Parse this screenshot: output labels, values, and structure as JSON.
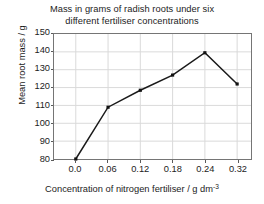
{
  "chart_data": {
    "type": "line",
    "title": "Mass in grams of radish roots under six different fertiliser concentrations",
    "title_lines": [
      "Mass in grams of radish roots under six",
      "different fertiliser concentrations"
    ],
    "xlabel": "Concentration of nitrogen fertiliser / g dm",
    "xlabel_exponent": "-3",
    "ylabel": "Mean root mass / g",
    "x_tick_labels": [
      "0.0",
      "0.06",
      "0.12",
      "0.18",
      "0.24",
      "0.32"
    ],
    "x": [
      0.0,
      0.06,
      0.12,
      0.18,
      0.24,
      0.32
    ],
    "categories": [
      "0.0",
      "0.06",
      "0.12",
      "0.18",
      "0.24",
      "0.32"
    ],
    "values": [
      80,
      109,
      118.5,
      127,
      139.5,
      122
    ],
    "y_tick_labels": [
      "150",
      "140",
      "130",
      "120",
      "110",
      "100",
      "90",
      "80"
    ],
    "y_ticks": [
      150,
      140,
      130,
      120,
      110,
      100,
      90,
      80
    ],
    "ylim": [
      80,
      150
    ],
    "grid": true,
    "legend": "none",
    "series": [
      {
        "name": "Mean root mass",
        "values": [
          80,
          109,
          118.5,
          127,
          139.5,
          122
        ],
        "color": "#1a1a1a",
        "marker": "square"
      }
    ],
    "colors": {
      "line": "#1a1a1a",
      "marker": "#111111",
      "grid": "#d9d9d9",
      "frame": "#757575",
      "text": "#1c1c1c",
      "background": "#ffffff"
    }
  }
}
